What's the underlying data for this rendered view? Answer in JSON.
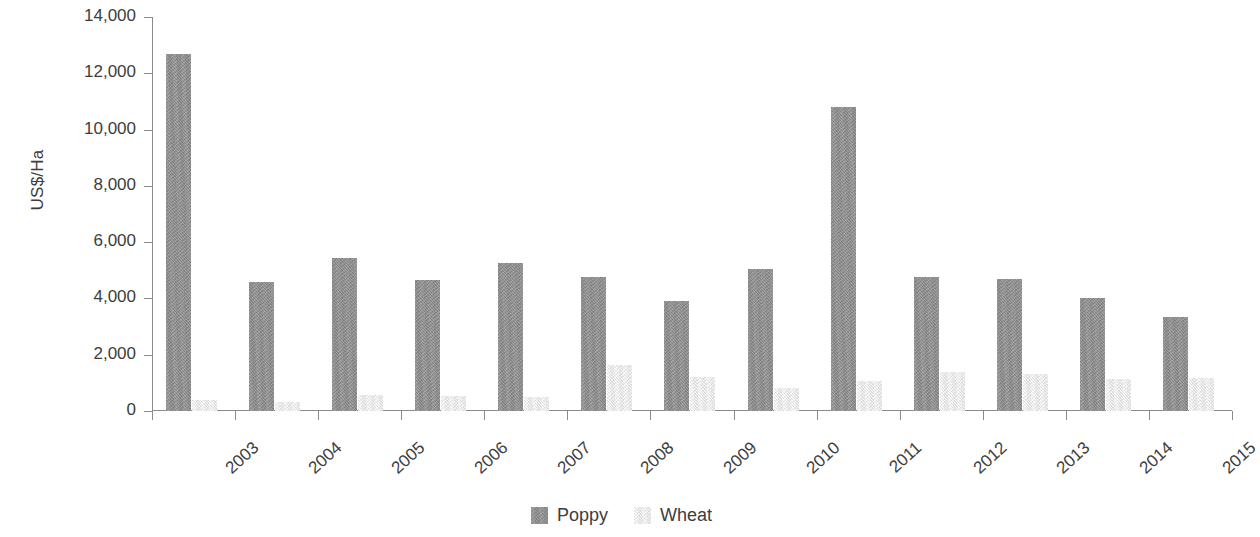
{
  "chart_data": {
    "type": "bar",
    "title": "",
    "subtitle": "",
    "xlabel": "",
    "ylabel": "US$/Ha",
    "ylim": [
      0,
      14000
    ],
    "ytick_step": 2000,
    "yticks": [
      "14,000",
      "12,000",
      "10,000",
      "8,000",
      "6,000",
      "4,000",
      "2,000",
      "0"
    ],
    "ytick_values": [
      14000,
      12000,
      10000,
      8000,
      6000,
      4000,
      2000,
      0
    ],
    "grid": false,
    "legend_position": "bottom-center",
    "categories": [
      "2003",
      "2004",
      "2005",
      "2006",
      "2007",
      "2008",
      "2009",
      "2010",
      "2011",
      "2012",
      "2013",
      "2014",
      "2015"
    ],
    "series": [
      {
        "name": "Poppy",
        "color": "#8e8e8e",
        "values": [
          12700,
          4600,
          5450,
          4650,
          5250,
          4750,
          3900,
          5050,
          10800,
          4750,
          4680,
          4030,
          3350
        ]
      },
      {
        "name": "Wheat",
        "color": "#eeeeee",
        "values": [
          400,
          330,
          560,
          520,
          500,
          1620,
          1200,
          830,
          1050,
          1400,
          1330,
          1140,
          1170
        ]
      }
    ]
  },
  "legend": {
    "items": [
      {
        "label": "Poppy",
        "color": "#8e8e8e"
      },
      {
        "label": "Wheat",
        "color": "#eeeeee"
      }
    ]
  },
  "axes": {
    "y_title": "US$/Ha"
  }
}
